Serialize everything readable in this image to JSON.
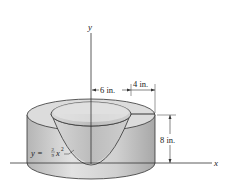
{
  "diagram": {
    "axes": {
      "x_label": "x",
      "y_label": "y"
    },
    "dimensions": {
      "inner_radius": "6 in.",
      "rim_width": "4 in.",
      "height": "8 in."
    },
    "curve": {
      "y": "y =",
      "num": "2",
      "den": "9",
      "x": "x",
      "exp": "2"
    },
    "colors": {
      "outer_wall": "#c9c9c9",
      "top_face": "#dcdcdc",
      "bowl": "#bdbdbd",
      "line": "#333333"
    }
  }
}
